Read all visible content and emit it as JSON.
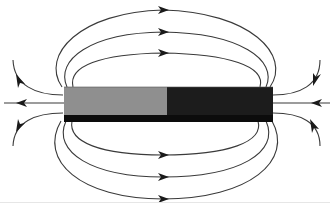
{
  "figure": {
    "title": "Magnetic field lines around a bar magnet",
    "magnet": {
      "left_pole_color": "#8f8f8f",
      "right_pole_color": "#1c1c1c",
      "edge_shadow_color": "#0c0c0c"
    },
    "field_lines": {
      "stroke_color": "#3a3a3a",
      "top_loops": 3,
      "bottom_loops": 3,
      "left_side_lines": 3,
      "right_side_lines": 3,
      "loop_arrow_direction": "right",
      "side_arrow_direction": "left"
    }
  }
}
